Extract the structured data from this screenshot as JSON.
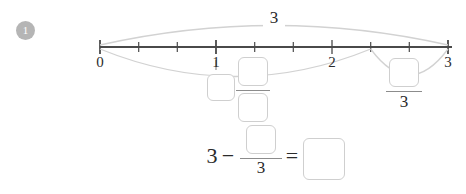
{
  "problem": {
    "number": "1"
  },
  "numberline": {
    "min": 0,
    "max": 3,
    "divisions_per_unit": 3,
    "major_ticks": [
      {
        "value": "0",
        "label": "0"
      },
      {
        "value": "1",
        "label": "1"
      },
      {
        "value": "2",
        "label": "2"
      },
      {
        "value": "3",
        "label": "3"
      }
    ],
    "minor_tick_count": 9
  },
  "arcs": {
    "top": {
      "from": "0",
      "to": "3",
      "label": "3",
      "name": "total-arc"
    },
    "lower_left": {
      "from": "0",
      "to": "7/3",
      "name": "minuend-arc"
    },
    "lower_right": {
      "from": "7/3",
      "to": "3",
      "name": "difference-arc"
    }
  },
  "mixed_number_entry": {
    "whole_value": "",
    "numerator_value": "",
    "denominator_value": ""
  },
  "right_fraction_entry": {
    "numerator_value": "",
    "denominator": "3"
  },
  "equation": {
    "whole": "3",
    "minus": "−",
    "numerator_value": "",
    "denominator": "3",
    "equals": "=",
    "answer_value": ""
  },
  "colors": {
    "axis": "#4a4a4a",
    "arc": "#d2d2d2",
    "box_border": "#cfcfcf",
    "badge": "#b5b5b5",
    "text": "#2b2b2b"
  }
}
